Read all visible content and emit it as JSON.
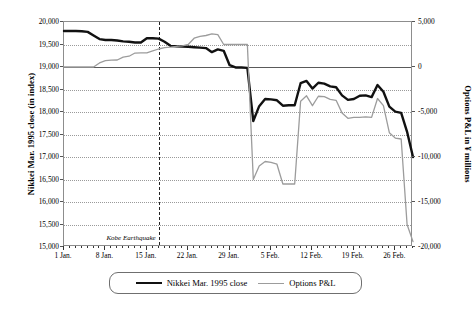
{
  "chart_data": {
    "type": "line",
    "title": "",
    "xlabel": "",
    "ylabel": "Nikkei Mar. 1995 close (in index)",
    "ylabel_right": "Options P&L in ¥ millions",
    "ylim": [
      15000,
      20000
    ],
    "ylim_right": [
      -20000,
      5000
    ],
    "ytick_labels": [
      "20,000",
      "19,500",
      "19,000",
      "18,500",
      "18,000",
      "17,500",
      "17,000",
      "16,500",
      "16,000",
      "15,500",
      "15,000"
    ],
    "ytick_values": [
      20000,
      19500,
      19000,
      18500,
      18000,
      17500,
      17000,
      16500,
      16000,
      15500,
      15000
    ],
    "ytick_labels_right": [
      "5,000",
      "0",
      "-5,000",
      "-10,000",
      "-15,000",
      "-20,000"
    ],
    "ytick_values_right": [
      5000,
      0,
      -5000,
      -10000,
      -15000,
      -20000
    ],
    "xtick_labels": [
      "1 Jan.",
      "8 Jan.",
      "15 Jan.",
      "22 Jan.",
      "29 Jan.",
      "5 Feb.",
      "12 Feb.",
      "19 Feb.",
      "26 Feb."
    ],
    "xtick_positions": [
      0,
      7,
      14,
      21,
      28,
      35,
      42,
      49,
      56
    ],
    "x_range": [
      0,
      59
    ],
    "grid": "horizontal-dotted",
    "legend_position": "bottom-center",
    "annotations": [
      {
        "label": "Kobe Earthquake",
        "x": 16,
        "style": "dashed-vertical-line",
        "italic": true
      }
    ],
    "series": [
      {
        "name": "Nikkei Mar. 1995 close",
        "color": "#111111",
        "width": 2.4,
        "axis": "left",
        "x": [
          0,
          1,
          2,
          3,
          4,
          5,
          6,
          7,
          8,
          9,
          10,
          11,
          12,
          13,
          14,
          15,
          16,
          17,
          18,
          19,
          20,
          21,
          22,
          23,
          24,
          25,
          26,
          27,
          28,
          29,
          30,
          31,
          32,
          33,
          34,
          35,
          36,
          37,
          38,
          39,
          40,
          41,
          42,
          43,
          44,
          45,
          46,
          47,
          48,
          49,
          50,
          51,
          52,
          53,
          54,
          55,
          56,
          57,
          58,
          59
        ],
        "y": [
          19800,
          19800,
          19800,
          19795,
          19780,
          19700,
          19620,
          19600,
          19600,
          19590,
          19570,
          19560,
          19545,
          19545,
          19640,
          19640,
          19630,
          19560,
          19470,
          19460,
          19455,
          19450,
          19440,
          19430,
          19420,
          19330,
          19390,
          19360,
          19040,
          18990,
          18990,
          18980,
          17800,
          18130,
          18290,
          18280,
          18260,
          18140,
          18150,
          18150,
          18640,
          18690,
          18520,
          18650,
          18630,
          18570,
          18550,
          18370,
          18270,
          18290,
          18360,
          18370,
          18330,
          18600,
          18450,
          18120,
          18010,
          17980,
          17560,
          17000
        ]
      },
      {
        "name": "Options P&L",
        "color": "#9c9c9c",
        "width": 1.3,
        "axis": "right",
        "x": [
          0,
          1,
          2,
          3,
          4,
          5,
          6,
          7,
          8,
          9,
          10,
          11,
          12,
          13,
          14,
          15,
          16,
          17,
          18,
          19,
          20,
          21,
          22,
          23,
          24,
          25,
          26,
          27,
          28,
          29,
          30,
          31,
          32,
          33,
          34,
          35,
          36,
          37,
          38,
          39,
          40,
          41,
          42,
          43,
          44,
          45,
          46,
          47,
          48,
          49,
          50,
          51,
          52,
          53,
          54,
          55,
          56,
          57,
          58,
          59
        ],
        "y": [
          0,
          0,
          0,
          0,
          0,
          0,
          450,
          700,
          760,
          780,
          1100,
          1200,
          1550,
          1560,
          1560,
          1780,
          2000,
          2150,
          2200,
          2300,
          2340,
          2500,
          3200,
          3400,
          3500,
          3680,
          3600,
          2500,
          2500,
          2500,
          2500,
          2500,
          -12500,
          -11000,
          -10500,
          -10600,
          -10800,
          -13000,
          -13000,
          -13000,
          -3800,
          -3200,
          -4300,
          -3250,
          -3300,
          -3600,
          -3700,
          -5100,
          -5700,
          -5600,
          -5600,
          -5550,
          -5600,
          -3500,
          -4300,
          -7300,
          -7900,
          -8000,
          -17500,
          -19400
        ]
      }
    ]
  },
  "legend": {
    "items": [
      {
        "label": "Nikkei Mar. 1995 close",
        "style": "thick-black-line"
      },
      {
        "label": "Options P&L",
        "style": "thin-gray-line"
      }
    ]
  }
}
